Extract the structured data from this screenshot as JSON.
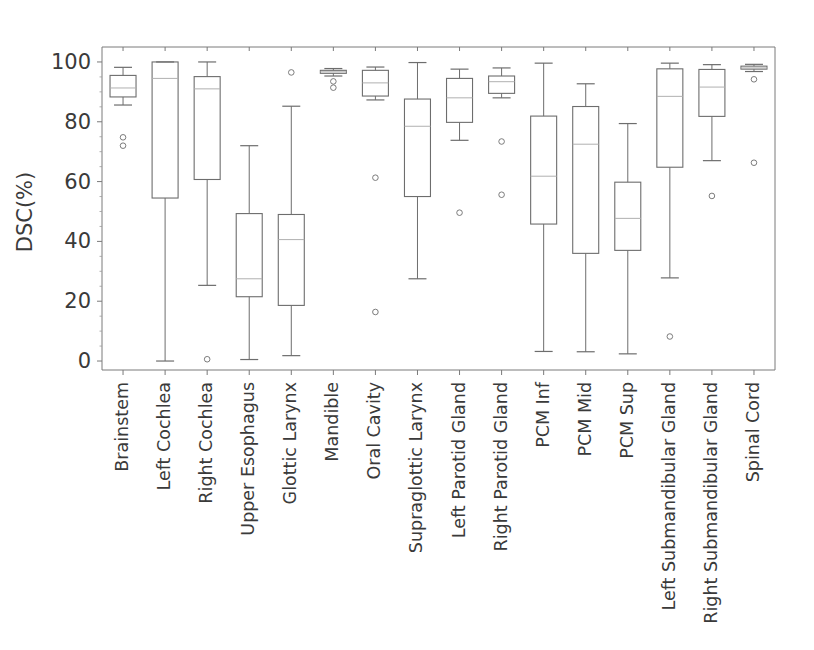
{
  "chart_data": {
    "type": "box",
    "title": "",
    "xlabel": "",
    "ylabel": "DSC(%)",
    "ylim": [
      -3,
      105
    ],
    "yticks": [
      0,
      20,
      40,
      60,
      80,
      100
    ],
    "ytick_labels": [
      "0",
      "20",
      "40",
      "60",
      "80",
      "100"
    ],
    "grid": false,
    "legend": null,
    "xtick_rotation": 90,
    "categories": [
      "Brainstem",
      "Left Cochlea",
      "Right Cochlea",
      "Upper Esophagus",
      "Glottic Larynx",
      "Mandible",
      "Oral Cavity",
      "Supraglottic Larynx",
      "Left Parotid Gland",
      "Right Parotid Gland",
      "PCM Inf",
      "PCM Mid",
      "PCM Sup",
      "Left Submandibular Gland",
      "Right Submandibular Gland",
      "Spinal Cord"
    ],
    "boxes": [
      {
        "label": "Brainstem",
        "whisker_low": 85.6,
        "q1": 88.3,
        "median": 91.3,
        "q3": 95.5,
        "whisker_high": 98.2,
        "outliers": [
          74.8,
          72.0
        ]
      },
      {
        "label": "Left Cochlea",
        "whisker_low": 0.0,
        "q1": 54.5,
        "median": 94.5,
        "q3": 100.0,
        "whisker_high": 100.0,
        "outliers": []
      },
      {
        "label": "Right Cochlea",
        "whisker_low": 25.3,
        "q1": 60.7,
        "median": 91.0,
        "q3": 95.1,
        "whisker_high": 100.0,
        "outliers": [
          0.6
        ]
      },
      {
        "label": "Upper Esophagus",
        "whisker_low": 0.5,
        "q1": 21.5,
        "median": 27.5,
        "q3": 49.3,
        "whisker_high": 72.0,
        "outliers": []
      },
      {
        "label": "Glottic Larynx",
        "whisker_low": 1.8,
        "q1": 18.6,
        "median": 40.6,
        "q3": 49.0,
        "whisker_high": 85.2,
        "outliers": [
          96.5
        ]
      },
      {
        "label": "Mandible",
        "whisker_low": 95.3,
        "q1": 96.2,
        "median": 96.7,
        "q3": 97.2,
        "whisker_high": 97.8,
        "outliers": [
          93.5,
          91.4
        ]
      },
      {
        "label": "Oral Cavity",
        "whisker_low": 87.3,
        "q1": 88.6,
        "median": 93.0,
        "q3": 97.2,
        "whisker_high": 98.3,
        "outliers": [
          61.3,
          16.4
        ]
      },
      {
        "label": "Supraglottic Larynx",
        "whisker_low": 27.5,
        "q1": 55.0,
        "median": 78.5,
        "q3": 87.6,
        "whisker_high": 99.8,
        "outliers": []
      },
      {
        "label": "Left Parotid Gland",
        "whisker_low": 73.8,
        "q1": 79.8,
        "median": 88.0,
        "q3": 94.5,
        "whisker_high": 97.6,
        "outliers": [
          49.6
        ]
      },
      {
        "label": "Right Parotid Gland",
        "whisker_low": 88.0,
        "q1": 89.5,
        "median": 93.4,
        "q3": 95.3,
        "whisker_high": 98.0,
        "outliers": [
          73.4,
          55.6
        ]
      },
      {
        "label": "PCM Inf",
        "whisker_low": 3.2,
        "q1": 45.8,
        "median": 61.8,
        "q3": 81.9,
        "whisker_high": 99.6,
        "outliers": []
      },
      {
        "label": "PCM Mid",
        "whisker_low": 3.1,
        "q1": 36.0,
        "median": 72.5,
        "q3": 85.1,
        "whisker_high": 92.7,
        "outliers": []
      },
      {
        "label": "PCM Sup",
        "whisker_low": 2.4,
        "q1": 37.0,
        "median": 47.7,
        "q3": 59.8,
        "whisker_high": 79.4,
        "outliers": []
      },
      {
        "label": "Left Submandibular Gland",
        "whisker_low": 27.8,
        "q1": 64.8,
        "median": 88.5,
        "q3": 97.7,
        "whisker_high": 99.6,
        "outliers": [
          8.2
        ]
      },
      {
        "label": "Right Submandibular Gland",
        "whisker_low": 67.0,
        "q1": 81.8,
        "median": 91.6,
        "q3": 97.5,
        "whisker_high": 99.1,
        "outliers": [
          55.2
        ]
      },
      {
        "label": "Spinal Cord",
        "whisker_low": 96.8,
        "q1": 97.6,
        "median": 98.0,
        "q3": 98.6,
        "whisker_high": 99.2,
        "outliers": [
          94.2,
          66.3
        ]
      }
    ],
    "colors": {
      "box_edge": "#6d6d6d",
      "median": "#b0b0b0",
      "whisker": "#6d6d6d",
      "flier": "#6d6d6d",
      "axis": "#7a7a7a",
      "text": "#3a3a3a",
      "background": "#ffffff"
    }
  }
}
